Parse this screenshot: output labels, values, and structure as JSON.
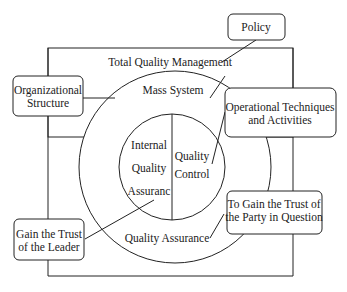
{
  "diagram": {
    "outer_label": "Total Quality Management",
    "mass_system": "Mass System",
    "inner_left": [
      "Internal",
      "Quality",
      "Assuranc"
    ],
    "inner_right": [
      "Quality",
      "Control"
    ],
    "ring_label": "Quality Assurance",
    "callouts": {
      "policy": "Policy",
      "org": [
        "Organizational",
        "Structure"
      ],
      "ops": [
        "Operational Techniques",
        "and Activities"
      ],
      "party": [
        "To Gain the Trust of",
        "the Party in Question"
      ],
      "leader": [
        "Gain the Trust",
        "of the Leader"
      ]
    }
  }
}
